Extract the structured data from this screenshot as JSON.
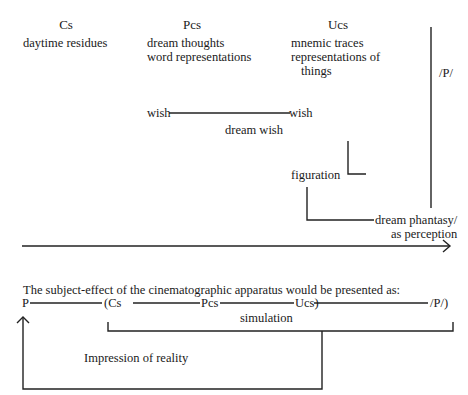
{
  "diagram": {
    "columns": {
      "cs": {
        "heading": "Cs",
        "items": [
          "daytime residues"
        ]
      },
      "pcs": {
        "heading": "Pcs",
        "items": [
          "dream thoughts",
          "word representations"
        ]
      },
      "ucs": {
        "heading": "Ucs",
        "items": [
          "mnemic traces",
          "representations of",
          "things"
        ]
      },
      "p": {
        "heading": "/P/"
      }
    },
    "flow": {
      "wish_left": "wish",
      "wish_right": "wish",
      "dream_wish": "dream wish",
      "figuration": "figuration",
      "dream_phantasy": "dream phantasy/",
      "as_perception": "as perception"
    },
    "caption": "The subject-effect of the cinematographic apparatus would be presented as:",
    "sequence": {
      "p": "P",
      "cs": "(Cs",
      "pcs": "Pcs",
      "ucs": "Ucs)",
      "p_end": "/P/)"
    },
    "simulation": "simulation",
    "impression": "Impression of reality"
  }
}
